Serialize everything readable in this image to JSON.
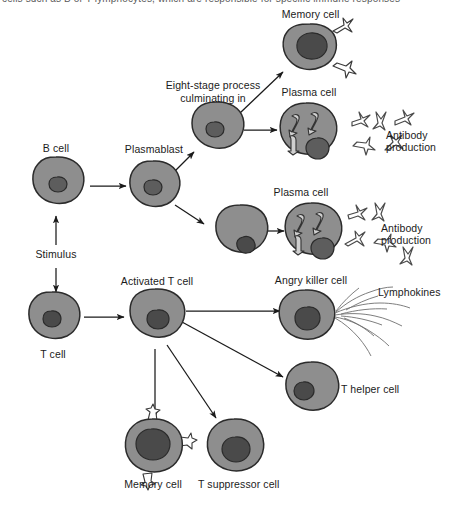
{
  "figure": {
    "type": "biological-flow-diagram",
    "cropped_header_text": "cells such as B or T lymphocytes, which are responsible for specific immune responses",
    "colors": {
      "cytoplasm": "#8e8e8e",
      "cytoplasm_light": "#9a9a9a",
      "nucleus": "#5d5d5d",
      "nucleus_dark": "#4a4a4a",
      "outline": "#2b2b2b",
      "arrow": "#1a1a1a",
      "background": "#ffffff",
      "antibody_stroke": "#4a4a4a",
      "lymphokine_stroke": "#6f6f6f"
    }
  },
  "labels": {
    "memory_cell_top": "Memory cell",
    "eight_stage": "Eight-stage process\nculminating in",
    "eight_stage_line1": "Eight-stage process",
    "eight_stage_line2": "culminating in",
    "plasma_cell_top": "Plasma cell",
    "plasma_cell_bottom": "Plasma cell",
    "antibody_production_top": "Antibody\nproduction",
    "antibody_production_top_line1": "Antibody",
    "antibody_production_top_line2": "production",
    "antibody_production_bottom_line1": "Antibody",
    "antibody_production_bottom_line2": "production",
    "b_cell": "B cell",
    "plasmablast": "Plasmablast",
    "stimulus": "Stimulus",
    "t_cell": "T cell",
    "activated_t_cell": "Activated T cell",
    "angry_killer_cell": "Angry killer cell",
    "lymphokines": "Lymphokines",
    "t_helper_cell": "T helper cell",
    "memory_cell_bottom": "Memory cell",
    "t_suppressor_cell": "T suppressor cell"
  },
  "cells": [
    {
      "id": "memory-cell-top",
      "label": "Memory cell",
      "cx": 310,
      "cy": 53,
      "has_receptors": true,
      "nucleus": "large-dark"
    },
    {
      "id": "b-cell",
      "label": "B cell",
      "cx": 56,
      "cy": 185,
      "has_receptors": false,
      "nucleus": "small"
    },
    {
      "id": "plasmablast",
      "label": "Plasmablast",
      "cx": 153,
      "cy": 188,
      "has_receptors": false,
      "nucleus": "small"
    },
    {
      "id": "intermediate-upper",
      "label": "",
      "cx": 217,
      "cy": 128,
      "has_receptors": false,
      "nucleus": "small"
    },
    {
      "id": "intermediate-lower",
      "label": "",
      "cx": 240,
      "cy": 232,
      "has_receptors": false,
      "nucleus": "small"
    },
    {
      "id": "plasma-cell-top",
      "label": "Plasma cell",
      "cx": 307,
      "cy": 131,
      "has_receptors": false,
      "nucleus": "er"
    },
    {
      "id": "plasma-cell-bottom",
      "label": "Plasma cell",
      "cx": 312,
      "cy": 231,
      "has_receptors": false,
      "nucleus": "er"
    },
    {
      "id": "t-cell",
      "label": "T cell",
      "cx": 52,
      "cy": 319,
      "has_receptors": false,
      "nucleus": "small"
    },
    {
      "id": "activated-t-cell",
      "label": "Activated T cell",
      "cx": 155,
      "cy": 318,
      "has_receptors": false,
      "nucleus": "small"
    },
    {
      "id": "angry-killer-cell",
      "label": "Angry killer cell",
      "cx": 308,
      "cy": 317,
      "has_receptors": false,
      "nucleus": "small"
    },
    {
      "id": "t-helper-cell",
      "label": "T helper cell",
      "cx": 311,
      "cy": 388,
      "has_receptors": false,
      "nucleus": "small"
    },
    {
      "id": "memory-cell-bottom",
      "label": "Memory cell",
      "cx": 152,
      "cy": 449,
      "has_receptors": true,
      "nucleus": "large-dark"
    },
    {
      "id": "t-suppressor-cell",
      "label": "T suppressor cell",
      "cx": 234,
      "cy": 448,
      "has_receptors": false,
      "nucleus": "medium"
    }
  ],
  "arrows": [
    {
      "from": "stimulus",
      "to": "b-cell"
    },
    {
      "from": "stimulus",
      "to": "t-cell"
    },
    {
      "from": "b-cell",
      "to": "plasmablast"
    },
    {
      "from": "plasmablast",
      "to": "intermediate-upper"
    },
    {
      "from": "plasmablast",
      "to": "intermediate-lower"
    },
    {
      "from": "intermediate-upper",
      "to": "memory-cell-top"
    },
    {
      "from": "intermediate-upper",
      "to": "plasma-cell-top"
    },
    {
      "from": "intermediate-lower",
      "to": "plasma-cell-bottom"
    },
    {
      "from": "t-cell",
      "to": "activated-t-cell"
    },
    {
      "from": "activated-t-cell",
      "to": "angry-killer-cell"
    },
    {
      "from": "activated-t-cell",
      "to": "t-helper-cell"
    },
    {
      "from": "activated-t-cell",
      "to": "memory-cell-bottom"
    },
    {
      "from": "activated-t-cell",
      "to": "t-suppressor-cell"
    }
  ],
  "antibody_clusters": [
    {
      "id": "antibodies-top",
      "count": 5,
      "near": "plasma-cell-top"
    },
    {
      "id": "antibodies-bottom",
      "count": 5,
      "near": "plasma-cell-bottom"
    }
  ]
}
